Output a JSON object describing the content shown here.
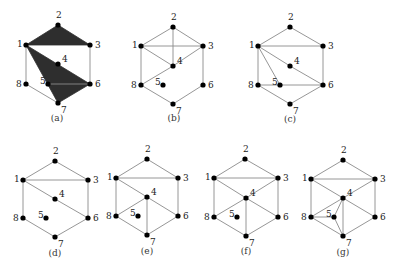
{
  "figure": {
    "panels": [
      {
        "id": "a",
        "caption": "(a)",
        "caption_pos": [
          57,
          121
        ],
        "vertices": {
          "1": [
            26,
            45
          ],
          "2": [
            58,
            25
          ],
          "3": [
            90,
            45
          ],
          "4": [
            58,
            64
          ],
          "5": [
            48,
            84
          ],
          "6": [
            90,
            84
          ],
          "7": [
            58,
            103
          ],
          "8": [
            26,
            84
          ]
        },
        "faces": [
          [
            "1",
            "2",
            "3"
          ],
          [
            "1",
            "6",
            "7"
          ]
        ],
        "edges": [
          [
            "1",
            "8"
          ],
          [
            "8",
            "7"
          ],
          [
            "3",
            "6"
          ],
          [
            "5",
            "6"
          ]
        ]
      },
      {
        "id": "b",
        "caption": "(b)",
        "caption_pos": [
          174,
          121
        ],
        "vertices": {
          "1": [
            141,
            46
          ],
          "2": [
            173,
            27
          ],
          "3": [
            203,
            46
          ],
          "4": [
            173,
            66
          ],
          "5": [
            163,
            85
          ],
          "6": [
            203,
            85
          ],
          "7": [
            173,
            104
          ],
          "8": [
            141,
            85
          ]
        },
        "faces": [],
        "edges": [
          [
            "1",
            "2"
          ],
          [
            "2",
            "3"
          ],
          [
            "1",
            "3"
          ],
          [
            "2",
            "4"
          ],
          [
            "1",
            "4"
          ],
          [
            "3",
            "4"
          ],
          [
            "4",
            "8"
          ],
          [
            "1",
            "8"
          ],
          [
            "8",
            "7"
          ],
          [
            "7",
            "6"
          ],
          [
            "6",
            "3"
          ]
        ]
      },
      {
        "id": "c",
        "caption": "(c)",
        "caption_pos": [
          290,
          122
        ],
        "vertices": {
          "1": [
            258,
            46
          ],
          "2": [
            290,
            27
          ],
          "3": [
            323,
            46
          ],
          "4": [
            290,
            66
          ],
          "5": [
            280,
            85
          ],
          "6": [
            323,
            85
          ],
          "7": [
            290,
            104
          ],
          "8": [
            258,
            85
          ]
        },
        "faces": [],
        "edges": [
          [
            "1",
            "2"
          ],
          [
            "2",
            "3"
          ],
          [
            "1",
            "3"
          ],
          [
            "1",
            "4"
          ],
          [
            "4",
            "6"
          ],
          [
            "1",
            "5"
          ],
          [
            "1",
            "8"
          ],
          [
            "8",
            "5"
          ],
          [
            "5",
            "6"
          ],
          [
            "3",
            "6"
          ],
          [
            "8",
            "7"
          ],
          [
            "7",
            "6"
          ]
        ]
      },
      {
        "id": "d",
        "caption": "(d)",
        "caption_pos": [
          55,
          256
        ],
        "vertices": {
          "1": [
            23,
            180
          ],
          "2": [
            55,
            161
          ],
          "3": [
            88,
            180
          ],
          "4": [
            55,
            199
          ],
          "5": [
            46,
            218
          ],
          "6": [
            88,
            218
          ],
          "7": [
            55,
            237
          ],
          "8": [
            23,
            218
          ]
        },
        "faces": [],
        "edges": [
          [
            "1",
            "2"
          ],
          [
            "2",
            "3"
          ],
          [
            "1",
            "3"
          ],
          [
            "1",
            "4"
          ],
          [
            "4",
            "6"
          ],
          [
            "1",
            "8"
          ],
          [
            "3",
            "6"
          ],
          [
            "8",
            "7"
          ],
          [
            "7",
            "6"
          ]
        ]
      },
      {
        "id": "e",
        "caption": "(e)",
        "caption_pos": [
          147,
          254
        ],
        "vertices": {
          "1": [
            116,
            178
          ],
          "2": [
            147,
            159
          ],
          "3": [
            178,
            178
          ],
          "4": [
            147,
            197
          ],
          "5": [
            138,
            216
          ],
          "6": [
            178,
            216
          ],
          "7": [
            147,
            235
          ],
          "8": [
            116,
            216
          ]
        },
        "faces": [],
        "edges": [
          [
            "1",
            "2"
          ],
          [
            "2",
            "3"
          ],
          [
            "1",
            "3"
          ],
          [
            "1",
            "4"
          ],
          [
            "4",
            "6"
          ],
          [
            "4",
            "8"
          ],
          [
            "4",
            "7"
          ],
          [
            "1",
            "8"
          ],
          [
            "3",
            "6"
          ],
          [
            "8",
            "7"
          ],
          [
            "7",
            "6"
          ]
        ]
      },
      {
        "id": "f",
        "caption": "(f)",
        "caption_pos": [
          246,
          254
        ],
        "vertices": {
          "1": [
            214,
            178
          ],
          "2": [
            245,
            159
          ],
          "3": [
            278,
            178
          ],
          "4": [
            246,
            198
          ],
          "5": [
            237,
            217
          ],
          "6": [
            278,
            217
          ],
          "7": [
            246,
            236
          ],
          "8": [
            214,
            217
          ]
        },
        "faces": [],
        "edges": [
          [
            "1",
            "2"
          ],
          [
            "2",
            "3"
          ],
          [
            "1",
            "3"
          ],
          [
            "1",
            "4"
          ],
          [
            "4",
            "6"
          ],
          [
            "4",
            "3"
          ],
          [
            "4",
            "8"
          ],
          [
            "4",
            "7"
          ],
          [
            "1",
            "8"
          ],
          [
            "3",
            "6"
          ],
          [
            "8",
            "7"
          ],
          [
            "7",
            "6"
          ]
        ]
      },
      {
        "id": "g",
        "caption": "(g)",
        "caption_pos": [
          343,
          255
        ],
        "vertices": {
          "1": [
            311,
            179
          ],
          "2": [
            343,
            160
          ],
          "3": [
            375,
            179
          ],
          "4": [
            343,
            198
          ],
          "5": [
            334,
            217
          ],
          "6": [
            375,
            217
          ],
          "7": [
            343,
            236
          ],
          "8": [
            311,
            217
          ]
        },
        "faces": [],
        "edges": [
          [
            "1",
            "2"
          ],
          [
            "2",
            "3"
          ],
          [
            "1",
            "3"
          ],
          [
            "1",
            "4"
          ],
          [
            "4",
            "3"
          ],
          [
            "4",
            "6"
          ],
          [
            "4",
            "8"
          ],
          [
            "4",
            "5"
          ],
          [
            "4",
            "7"
          ],
          [
            "8",
            "5"
          ],
          [
            "5",
            "7"
          ],
          [
            "1",
            "8"
          ],
          [
            "8",
            "7"
          ],
          [
            "3",
            "6"
          ],
          [
            "7",
            "6"
          ]
        ]
      }
    ],
    "label_offsets": {
      "1": [
        -9,
        2
      ],
      "2": [
        -2,
        -7
      ],
      "3": [
        5,
        3
      ],
      "4": [
        4,
        -2
      ],
      "5": [
        -8,
        0
      ],
      "6": [
        5,
        3
      ],
      "7": [
        3,
        10
      ],
      "8": [
        -10,
        3
      ]
    },
    "colors": {
      "edge": "#8a8a8a",
      "face": "#2e2e2e",
      "vertex": "#000000",
      "text": "#222222"
    }
  }
}
